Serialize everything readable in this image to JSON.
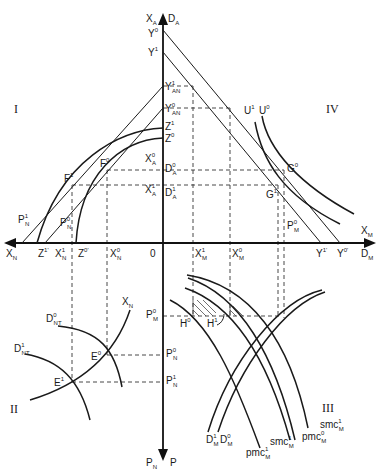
{
  "figure": {
    "type": "four-quadrant trade/production diagram",
    "quadrants": [
      "I",
      "II",
      "III",
      "IV"
    ],
    "axes": {
      "top": [
        "X",
        "A",
        "D",
        "A"
      ],
      "bottom": [
        "P",
        "N",
        "P",
        ""
      ],
      "left": [
        "X",
        "N"
      ],
      "right": [
        "D",
        "M"
      ],
      "origin": "0"
    },
    "vertical_axis_labels": [
      {
        "id": "Y0",
        "base": "Y",
        "sup": "0",
        "sub": ""
      },
      {
        "id": "Y1",
        "base": "Y",
        "sup": "1",
        "sub": ""
      },
      {
        "id": "Y1AN",
        "base": "Y",
        "sup": "1",
        "sub": "AN"
      },
      {
        "id": "Y0AN",
        "base": "Y",
        "sup": "0",
        "sub": "AN"
      },
      {
        "id": "Z1",
        "base": "Z",
        "sup": "1",
        "sub": ""
      },
      {
        "id": "Z0",
        "base": "Z",
        "sup": "0",
        "sub": ""
      },
      {
        "id": "X0A",
        "base": "X",
        "sup": "0",
        "sub": "A"
      },
      {
        "id": "D0A",
        "base": "D",
        "sup": "0",
        "sub": "A"
      },
      {
        "id": "X1A",
        "base": "X",
        "sup": "1",
        "sub": "A"
      },
      {
        "id": "D1A",
        "base": "D",
        "sup": "1",
        "sub": "A"
      },
      {
        "id": "P0M",
        "base": "P",
        "sup": "0",
        "sub": "M"
      },
      {
        "id": "P0N_axis",
        "base": "P",
        "sup": "0",
        "sub": "N"
      },
      {
        "id": "P1N_axis",
        "base": "P",
        "sup": "1",
        "sub": "N"
      }
    ],
    "horizontal_axis_labels": [
      {
        "id": "XN",
        "base": "X",
        "sup": "",
        "sub": "N"
      },
      {
        "id": "Z1p",
        "base": "Z",
        "sup": "1'",
        "sub": ""
      },
      {
        "id": "X1N",
        "base": "X",
        "sup": "1",
        "sub": "N"
      },
      {
        "id": "Z0p",
        "base": "Z",
        "sup": "0'",
        "sub": ""
      },
      {
        "id": "X0N",
        "base": "X",
        "sup": "0",
        "sub": "N"
      },
      {
        "id": "O",
        "base": "0",
        "sup": "",
        "sub": ""
      },
      {
        "id": "X1M",
        "base": "X",
        "sup": "1",
        "sub": "M"
      },
      {
        "id": "X0M",
        "base": "X",
        "sup": "0",
        "sub": "M"
      },
      {
        "id": "Y1p",
        "base": "Y",
        "sup": "1'",
        "sub": ""
      },
      {
        "id": "Y0p",
        "base": "Y",
        "sup": "0'",
        "sub": ""
      },
      {
        "id": "DM",
        "base": "D",
        "sup": "",
        "sub": "M"
      }
    ],
    "quadrant_I_labels": [
      {
        "id": "F1",
        "base": "F",
        "sup": "1",
        "sub": ""
      },
      {
        "id": "F0",
        "base": "F",
        "sup": "0",
        "sub": ""
      },
      {
        "id": "P1N",
        "base": "P",
        "sup": "1",
        "sub": "N"
      },
      {
        "id": "P0N",
        "base": "P",
        "sup": "0",
        "sub": "N"
      }
    ],
    "quadrant_IV_labels": [
      {
        "id": "U1",
        "base": "U",
        "sup": "1",
        "sub": ""
      },
      {
        "id": "U0",
        "base": "U",
        "sup": "0",
        "sub": ""
      },
      {
        "id": "G0",
        "base": "G",
        "sup": "0",
        "sub": ""
      },
      {
        "id": "G1",
        "base": "G",
        "sup": "1",
        "sub": ""
      },
      {
        "id": "P0M_q4",
        "base": "P",
        "sup": "0",
        "sub": "M"
      },
      {
        "id": "XM",
        "base": "X",
        "sup": "",
        "sub": "M"
      }
    ],
    "quadrant_II_labels": [
      {
        "id": "XN_q2",
        "base": "X",
        "sup": "",
        "sub": "N"
      },
      {
        "id": "D0NT",
        "base": "D",
        "sup": "0",
        "sub": "NT"
      },
      {
        "id": "D1NT",
        "base": "D",
        "sup": "1",
        "sub": "NT"
      },
      {
        "id": "E0",
        "base": "E",
        "sup": "0",
        "sub": ""
      },
      {
        "id": "E1",
        "base": "E",
        "sup": "1",
        "sub": ""
      }
    ],
    "quadrant_III_labels": [
      {
        "id": "H0",
        "base": "H",
        "sup": "0",
        "sub": ""
      },
      {
        "id": "H1",
        "base": "H",
        "sup": "1",
        "sub": ""
      },
      {
        "id": "D1M",
        "base": "D",
        "sup": "1",
        "sub": "M"
      },
      {
        "id": "D0M",
        "base": "D",
        "sup": "0",
        "sub": "M"
      },
      {
        "id": "pmc1M",
        "base": "pmc",
        "sup": "1",
        "sub": "M"
      },
      {
        "id": "smc1M_a",
        "base": "smc",
        "sup": "1",
        "sub": "M"
      },
      {
        "id": "pmc0M",
        "base": "pmc",
        "sup": "0",
        "sub": "M"
      },
      {
        "id": "smc1M_b",
        "base": "smc",
        "sup": "1",
        "sub": "M"
      }
    ],
    "colors": {
      "ink": "#1a1a1a",
      "background": "#ffffff"
    }
  }
}
